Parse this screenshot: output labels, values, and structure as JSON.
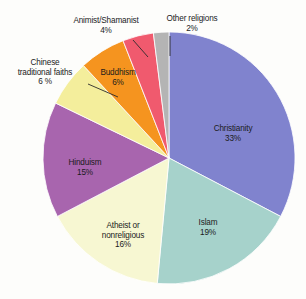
{
  "chart_data": {
    "type": "pie",
    "title": "",
    "subtitle": "",
    "xlabel": "",
    "ylabel": "",
    "legend_position": "none",
    "grid": false,
    "labels_inside_slices": [
      "Christianity",
      "Islam",
      "Atheist or nonreligious",
      "Hinduism",
      "Buddhism"
    ],
    "labels_outside_slices": [
      "Chinese traditional faiths",
      "Animist/Shamanist",
      "Other religions"
    ],
    "start_angle_deg": 0,
    "direction": "clockwise",
    "categories": [
      "Christianity",
      "Islam",
      "Atheist or nonreligious",
      "Hinduism",
      "Chinese traditional faiths",
      "Buddhism",
      "Animist/Shamanist",
      "Other religions"
    ],
    "values": [
      33,
      19,
      16,
      15,
      6,
      6,
      4,
      2
    ],
    "value_labels": [
      "33%",
      "19%",
      "16%",
      "15%",
      "6 %",
      "6%",
      "4%",
      "2%"
    ],
    "colors": [
      "#8083ce",
      "#a6d2cb",
      "#f7f7d2",
      "#a865ae",
      "#f4ee9c",
      "#f5941f",
      "#f05a6e",
      "#b4b4b4"
    ],
    "slices": [
      {
        "name": "Christianity",
        "value": 33,
        "value_label": "33%",
        "color": "#8083ce",
        "label_line1": "Christianity",
        "label_line2": "33%"
      },
      {
        "name": "Islam",
        "value": 19,
        "value_label": "19%",
        "color": "#a6d2cb",
        "label_line1": "Islam",
        "label_line2": "19%"
      },
      {
        "name": "Atheist or nonreligious",
        "value": 16,
        "value_label": "16%",
        "color": "#f7f7d2",
        "label_line1": "Atheist or",
        "label_line2": "nonreligious",
        "label_line3": "16%"
      },
      {
        "name": "Hinduism",
        "value": 15,
        "value_label": "15%",
        "color": "#a865ae",
        "label_line1": "Hinduism",
        "label_line2": "15%"
      },
      {
        "name": "Chinese traditional faiths",
        "value": 6,
        "value_label": "6 %",
        "color": "#f4ee9c",
        "label_line1": "Chinese",
        "label_line2": "traditional faiths",
        "label_line3": "6 %"
      },
      {
        "name": "Buddhism",
        "value": 6,
        "value_label": "6%",
        "color": "#f5941f",
        "label_line1": "Buddhism",
        "label_line2": "6%"
      },
      {
        "name": "Animist/Shamanist",
        "value": 4,
        "value_label": "4%",
        "color": "#f05a6e",
        "label_line1": "Animist/Shamanist",
        "label_line2": "4%"
      },
      {
        "name": "Other religions",
        "value": 2,
        "value_label": "2%",
        "color": "#b4b4b4",
        "label_line1": "Other religions",
        "label_line2": "2%"
      }
    ]
  },
  "labels": {
    "christianity": "Christianity\n33%",
    "islam": "Islam\n19%",
    "atheist": "Atheist or\nnonreligious\n16%",
    "hinduism": "Hinduism\n15%",
    "chinese": "Chinese\ntraditional faiths\n6 %",
    "buddhism": "Buddhism\n6%",
    "animist": "Animist/Shamanist\n4%",
    "other": "Other religions\n2%"
  }
}
